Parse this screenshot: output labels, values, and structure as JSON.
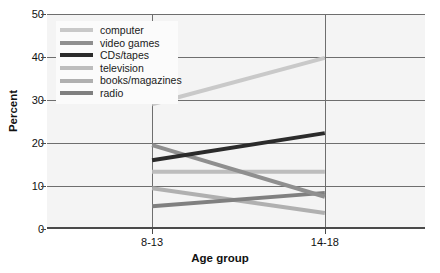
{
  "chart_data": {
    "type": "line",
    "title": "",
    "xlabel": "Age group",
    "ylabel": "Percent",
    "categories": [
      "8-13",
      "14-18"
    ],
    "ylim": [
      0,
      50
    ],
    "yticks": [
      0,
      10,
      20,
      30,
      40,
      50
    ],
    "grid": true,
    "legend_position": "upper-left",
    "series": [
      {
        "name": "computer",
        "values": [
          29.0,
          39.8
        ],
        "color": "#c9c9c9"
      },
      {
        "name": "video games",
        "values": [
          19.5,
          7.5
        ],
        "color": "#8f8f8f"
      },
      {
        "name": "CDs/tapes",
        "values": [
          16.0,
          22.3
        ],
        "color": "#2b2b2b"
      },
      {
        "name": "television",
        "values": [
          13.3,
          13.3
        ],
        "color": "#bdbdbd"
      },
      {
        "name": "books/magazines",
        "values": [
          9.5,
          3.7
        ],
        "color": "#b0b0b0"
      },
      {
        "name": "radio",
        "values": [
          5.3,
          8.4
        ],
        "color": "#808080"
      }
    ]
  },
  "axis": {
    "y_tick_labels": [
      "0",
      "10",
      "20",
      "30",
      "40",
      "50"
    ],
    "x_tick_labels": [
      "8-13",
      "14-18"
    ],
    "x_title": "Age group",
    "y_title": "Percent"
  },
  "legend": {
    "entries": [
      {
        "label": "computer"
      },
      {
        "label": "video games"
      },
      {
        "label": "CDs/tapes"
      },
      {
        "label": "television"
      },
      {
        "label": "books/magazines"
      },
      {
        "label": "radio"
      }
    ]
  },
  "colors": {
    "plot_background": "#f4f4f4",
    "gridline": "#6e6e6e",
    "axis": "#4a4a4a",
    "text": "#111111",
    "legend_background": "#fbfbfb"
  }
}
